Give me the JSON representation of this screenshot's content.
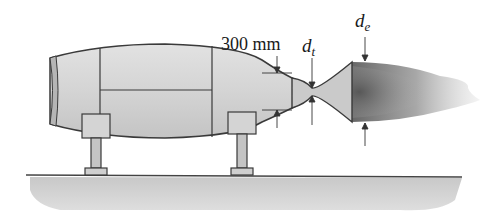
{
  "figure": {
    "labels": {
      "dimension": "300 mm",
      "throat_symbol": "d",
      "throat_subscript": "t",
      "exit_symbol": "d",
      "exit_subscript": "e"
    },
    "colors": {
      "body_fill": "#d6d6d6",
      "outline": "#3a3a3a",
      "ground": "#cfcfcf",
      "plume": "#6e6e6e"
    }
  }
}
